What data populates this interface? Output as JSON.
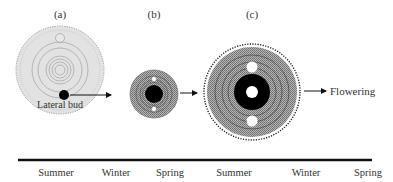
{
  "stages": [
    {
      "id": "a",
      "label": "(a)",
      "annotation": "Lateral bud"
    },
    {
      "id": "b",
      "label": "(b)"
    },
    {
      "id": "c",
      "label": "(c)"
    }
  ],
  "outcome": {
    "label": "Flowering"
  },
  "timeline": {
    "seasons": [
      "Summer",
      "Winter",
      "Spring",
      "Summer",
      "Winter",
      "Spring"
    ]
  },
  "colors": {
    "stage_a_fill": "#e2e2e2",
    "hatch": "#8a8a8a",
    "core": "#000000",
    "line": "#111111"
  }
}
